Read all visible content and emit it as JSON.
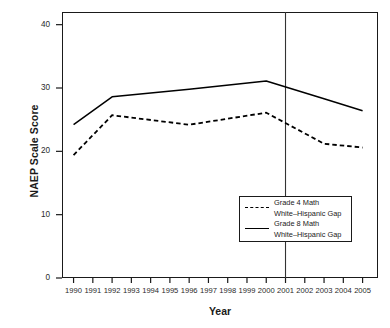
{
  "chart_data": {
    "type": "line",
    "title": "",
    "xlabel": "Year",
    "ylabel": "NAEP Scale Score",
    "xlim": [
      1989.4,
      2005.8
    ],
    "ylim": [
      0,
      42
    ],
    "yticks": [
      0,
      10,
      20,
      30,
      40
    ],
    "xticks": [
      1990,
      1991,
      1992,
      1993,
      1994,
      1995,
      1996,
      1997,
      1998,
      1999,
      2000,
      2001,
      2002,
      2003,
      2004,
      2005
    ],
    "xtick_labels": [
      "1990",
      "1991",
      "1992",
      "1993",
      "1994",
      "1995",
      "1996",
      "1997",
      "1998",
      "1999",
      "2000",
      "2001",
      "2002",
      "2003",
      "2004",
      "2005"
    ],
    "ytick_labels": [
      "0",
      "10",
      "20",
      "30",
      "40"
    ],
    "grid": false,
    "legend_position": "inside-lower-right",
    "annotations": [
      {
        "name": "reference-line-2001",
        "type": "vline",
        "x": 2001,
        "style": "solid",
        "color": "#333333"
      }
    ],
    "series": [
      {
        "name": "Grade 4 Math\nWhite–Hispanic Gap",
        "legend_line1": "Grade 4 Math",
        "legend_line2": "White–Hispanic Gap",
        "style": "dashed",
        "color": "#000000",
        "x": [
          1990,
          1992,
          1996,
          2000,
          2003,
          2005
        ],
        "values": [
          19.4,
          25.7,
          24.2,
          26.1,
          21.2,
          20.6
        ]
      },
      {
        "name": "Grade 8 Math\nWhite–Hispanic Gap",
        "legend_line1": "Grade 8 Math",
        "legend_line2": "White–Hispanic Gap",
        "style": "solid",
        "color": "#000000",
        "x": [
          1990,
          1992,
          1996,
          2000,
          2003,
          2005
        ],
        "values": [
          24.2,
          28.6,
          29.8,
          31.1,
          28.3,
          26.4
        ]
      }
    ]
  },
  "axes": {
    "y_title": "NAEP Scale Score",
    "x_title": "Year"
  },
  "legend": {
    "entries": [
      {
        "line1": "Grade 4 Math",
        "line2": "White–Hispanic Gap",
        "style": "dashed"
      },
      {
        "line1": "Grade 8 Math",
        "line2": "White–Hispanic Gap",
        "style": "solid"
      }
    ]
  },
  "colors": {
    "line": "#000000",
    "frame": "#1a1a1a",
    "reference": "#333333",
    "background": "#ffffff"
  }
}
